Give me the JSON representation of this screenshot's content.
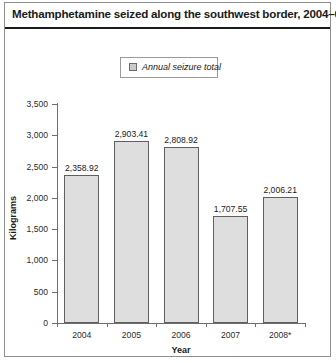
{
  "figure": {
    "title": "Methamphetamine seized along the southwest border, 2004–08"
  },
  "legend": {
    "swatch_name": "legend-swatch",
    "label": "Annual seizure total",
    "position": "top-center"
  },
  "chart_data": {
    "type": "bar",
    "title": "Methamphetamine seized along the southwest border, 2004–08",
    "categories": [
      "2004",
      "2005",
      "2006",
      "2007",
      "2008*"
    ],
    "values": [
      2358.92,
      2903.41,
      2808.92,
      1707.55,
      2006.21
    ],
    "value_labels": [
      "2,358.92",
      "2,903.41",
      "2,808.92",
      "1,707.55",
      "2,006.21"
    ],
    "series": [
      {
        "name": "Annual seizure total",
        "values": [
          2358.92,
          2903.41,
          2808.92,
          1707.55,
          2006.21
        ]
      }
    ],
    "xlabel": "Year",
    "ylabel": "Kilograms",
    "ylim": [
      0,
      3500
    ],
    "yticks": [
      0,
      500,
      1000,
      1500,
      2000,
      2500,
      3000,
      3500
    ],
    "ytick_labels": [
      "0",
      "500",
      "1,000",
      "1,500",
      "2,000",
      "2,500",
      "3,000",
      "3,500"
    ],
    "grid": false,
    "bar_fill_color": "#dedede",
    "bar_border_color": "#5f5f5f",
    "axis_color": "#6e6e6e",
    "text_color": "#1a1a1a"
  }
}
